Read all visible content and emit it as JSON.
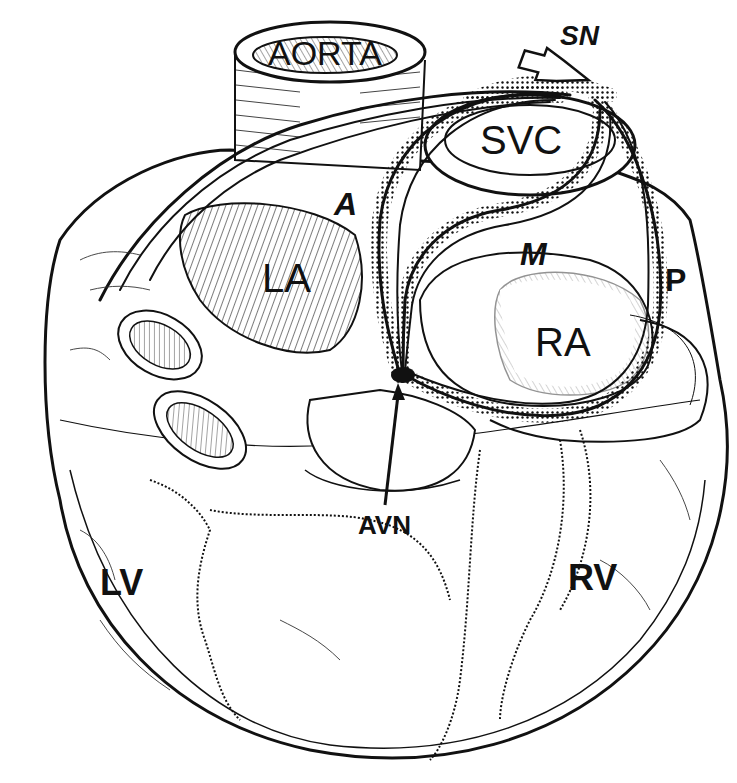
{
  "diagram": {
    "type": "anatomical-illustration",
    "labels": {
      "aorta": "AORTA",
      "svc": "SVC",
      "sn": "SN",
      "a": "A",
      "la": "LA",
      "m": "M",
      "p": "P",
      "ra": "RA",
      "avn": "AVN",
      "lv": "LV",
      "rv": "RV"
    },
    "pathways": [
      {
        "name": "anterior internodal tract",
        "label": "A",
        "from": "SN",
        "to": "AVN"
      },
      {
        "name": "middle internodal tract",
        "label": "M",
        "from": "SN",
        "to": "AVN"
      },
      {
        "name": "posterior internodal tract",
        "label": "P",
        "from": "SN",
        "to": "AVN"
      }
    ],
    "colors": {
      "ink": "#111111",
      "background": "#ffffff"
    }
  }
}
